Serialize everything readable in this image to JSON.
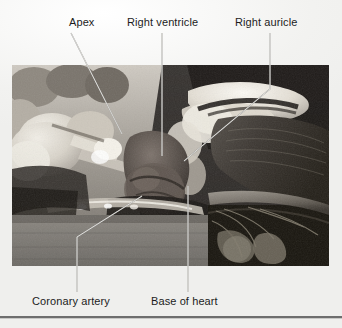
{
  "figure": {
    "kind": "anatomical-dissection-photograph",
    "tone": "grayscale"
  },
  "labels": [
    {
      "id": "apex",
      "text": "Apex",
      "position": "top-left"
    },
    {
      "id": "right-ventricle",
      "text": "Right ventricle",
      "position": "top-center"
    },
    {
      "id": "right-auricle",
      "text": "Right auricle",
      "position": "top-right"
    },
    {
      "id": "coronary-artery",
      "text": "Coronary artery",
      "position": "bottom-left"
    },
    {
      "id": "base-of-heart",
      "text": "Base of heart",
      "position": "bottom-center"
    }
  ],
  "colors": {
    "page_background": "#f4f4f2",
    "label_text": "#1c1c1c",
    "leader_line": "#f0f0ee",
    "rule": "#6e6e6e",
    "photo_dark": "#241f1c",
    "photo_light": "#e8e4dc"
  }
}
